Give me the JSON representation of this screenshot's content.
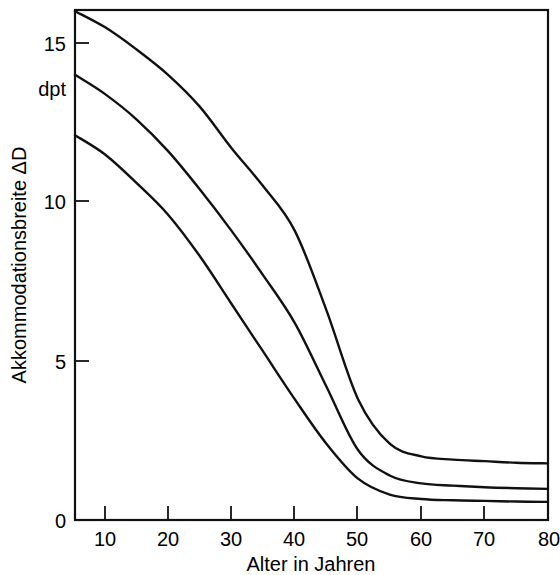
{
  "chart_data": {
    "type": "line",
    "title": "",
    "xlabel": "Alter in Jahren",
    "ylabel": "Akkommodationsbreite ΔD",
    "yunit": "dpt",
    "xlim": [
      5.3,
      80
    ],
    "ylim": [
      0,
      16.5
    ],
    "xticks": [
      10,
      20,
      30,
      40,
      50,
      60,
      70,
      80
    ],
    "xtick_labels": [
      "10",
      "20",
      "30",
      "40",
      "50",
      "60",
      "70",
      "80"
    ],
    "yticks": [
      0,
      5,
      10,
      15
    ],
    "ytick_labels": [
      "0",
      "5",
      "10",
      "15"
    ],
    "grid": false,
    "legend": "none",
    "line_color": "#111111",
    "background": "#ffffff",
    "x": [
      5.3,
      10,
      15,
      20,
      25,
      30,
      35,
      40,
      45,
      50,
      55,
      60,
      65,
      70,
      75,
      80
    ],
    "series": [
      {
        "name": "obere Grenzkurve",
        "values": [
          16.0,
          15.5,
          14.8,
          14.0,
          13.0,
          11.7,
          10.5,
          9.1,
          6.6,
          3.8,
          2.4,
          2.0,
          1.9,
          1.85,
          1.8,
          1.78
        ]
      },
      {
        "name": "mittlere Kurve",
        "values": [
          14.0,
          13.4,
          12.6,
          11.6,
          10.4,
          9.1,
          7.7,
          6.2,
          4.2,
          2.2,
          1.4,
          1.15,
          1.08,
          1.03,
          1.0,
          0.98
        ]
      },
      {
        "name": "untere Grenzkurve",
        "values": [
          12.1,
          11.5,
          10.6,
          9.6,
          8.3,
          6.8,
          5.3,
          3.8,
          2.4,
          1.3,
          0.8,
          0.66,
          0.62,
          0.6,
          0.58,
          0.57
        ]
      }
    ]
  },
  "axes": {
    "y_axis_title": "Akkommodationsbreite ΔD",
    "y_unit": "dpt",
    "x_axis_title": "Alter in Jahren",
    "y_tick_labels": [
      "15",
      "10",
      "5",
      "0"
    ],
    "x_tick_labels": [
      "10",
      "20",
      "30",
      "40",
      "50",
      "60",
      "70",
      "80"
    ]
  }
}
